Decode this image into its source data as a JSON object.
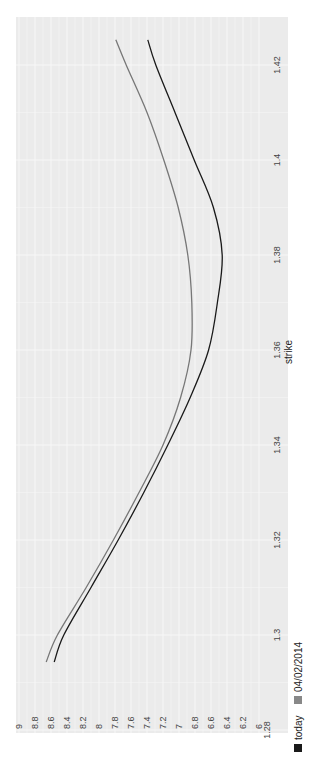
{
  "chart_data": {
    "type": "line",
    "orientation": "rotated-90-ccw",
    "title": "",
    "xlabel": "strike",
    "ylabel": "",
    "xlim": [
      1.28,
      1.43
    ],
    "ylim": [
      6,
      9
    ],
    "x_ticks": [
      "1.28",
      "1.3",
      "1.32",
      "1.34",
      "1.36",
      "1.38",
      "1.4",
      "1.42"
    ],
    "y_ticks": [
      "6",
      "6.2",
      "6.4",
      "6.6",
      "6.8",
      "7",
      "7.2",
      "7.4",
      "7.6",
      "7.8",
      "8",
      "8.2",
      "8.4",
      "8.6",
      "8.8",
      "9"
    ],
    "grid": true,
    "legend_position": "bottom",
    "x": [
      1.2943,
      1.3,
      1.31,
      1.32,
      1.33,
      1.34,
      1.35,
      1.36,
      1.37,
      1.38,
      1.39,
      1.4,
      1.41,
      1.42,
      1.4253
    ],
    "series": [
      {
        "name": "today",
        "color": "#1a1a1a",
        "values": [
          8.56,
          8.44,
          8.1,
          7.76,
          7.44,
          7.14,
          6.86,
          6.63,
          6.52,
          6.46,
          6.57,
          6.81,
          7.05,
          7.29,
          7.39
        ]
      },
      {
        "name": "04/02/2014",
        "color": "#777777",
        "values": [
          8.66,
          8.52,
          8.16,
          7.82,
          7.5,
          7.2,
          6.98,
          6.85,
          6.84,
          6.89,
          7.01,
          7.19,
          7.4,
          7.66,
          7.79
        ]
      }
    ]
  },
  "legend": {
    "items": [
      {
        "label": "today",
        "color": "#1a1a1a"
      },
      {
        "label": "04/02/2014",
        "color": "#888888"
      }
    ]
  },
  "style": {
    "plot_background": "#ebebeb",
    "grid_color": "#ffffff"
  }
}
